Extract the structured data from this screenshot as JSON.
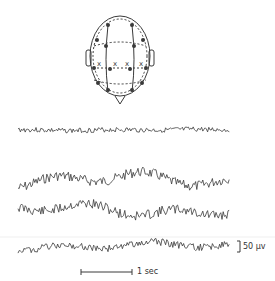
{
  "figure": {
    "scale_amplitude_label": "50 μv",
    "scale_time_label": "1 sec",
    "electrode_marker": "x",
    "ink_color": "#3a3a3a"
  },
  "traces": [
    {
      "name": "trace-1",
      "y": 130,
      "amp": 2.5,
      "slow": 0.6,
      "seed": 3
    },
    {
      "name": "trace-2",
      "y": 180,
      "amp": 5,
      "slow": 8,
      "seed": 7
    },
    {
      "name": "trace-3",
      "y": 210,
      "amp": 5,
      "slow": 7,
      "seed": 11
    },
    {
      "name": "trace-4",
      "y": 246,
      "amp": 3.5,
      "slow": 4,
      "seed": 19
    }
  ]
}
